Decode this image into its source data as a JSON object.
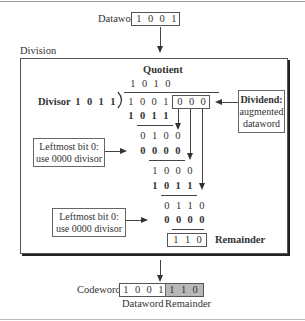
{
  "dataword": {
    "label": "Dataword",
    "bits": [
      "1",
      "0",
      "0",
      "1"
    ]
  },
  "division": {
    "label": "Division",
    "quotient_label": "Quotient",
    "quotient_bits": [
      "1",
      "0",
      "1",
      "0"
    ],
    "divisor_label": "Divisor",
    "divisor_bits": [
      "1",
      "0",
      "1",
      "1"
    ],
    "dividend_bits": [
      "1",
      "0",
      "0",
      "1"
    ],
    "augmented_bits": [
      "0",
      "0",
      "0"
    ],
    "dividend_note": [
      "Dividend:",
      "augmented",
      "dataword"
    ],
    "steps": [
      {
        "bits": [
          "1",
          "0",
          "1",
          "1"
        ],
        "bold": true
      },
      {
        "bits": [
          "0",
          "1",
          "0",
          "0"
        ],
        "bold": false
      },
      {
        "bits": [
          "0",
          "0",
          "0",
          "0"
        ],
        "bold": true
      },
      {
        "bits": [
          "1",
          "0",
          "0",
          "0"
        ],
        "bold": false
      },
      {
        "bits": [
          "1",
          "0",
          "1",
          "1"
        ],
        "bold": true
      },
      {
        "bits": [
          "0",
          "1",
          "1",
          "0"
        ],
        "bold": false
      },
      {
        "bits": [
          "0",
          "0",
          "0",
          "0"
        ],
        "bold": true
      }
    ],
    "note_leftmost_1": [
      "Leftmost bit 0:",
      "use 0000 divisor"
    ],
    "note_leftmost_2": [
      "Leftmost bit 0:",
      "use 0000 divisor"
    ],
    "remainder_bits": [
      "1",
      "1",
      "0"
    ],
    "remainder_label": "Remainder"
  },
  "codeword": {
    "label": "Codeword",
    "dataword_bits": [
      "1",
      "0",
      "0",
      "1"
    ],
    "remainder_bits": [
      "1",
      "1",
      "0"
    ],
    "dataword_caption": "Dataword",
    "remainder_caption": "Remainder",
    "remainder_fill": "#b8b8b8"
  }
}
